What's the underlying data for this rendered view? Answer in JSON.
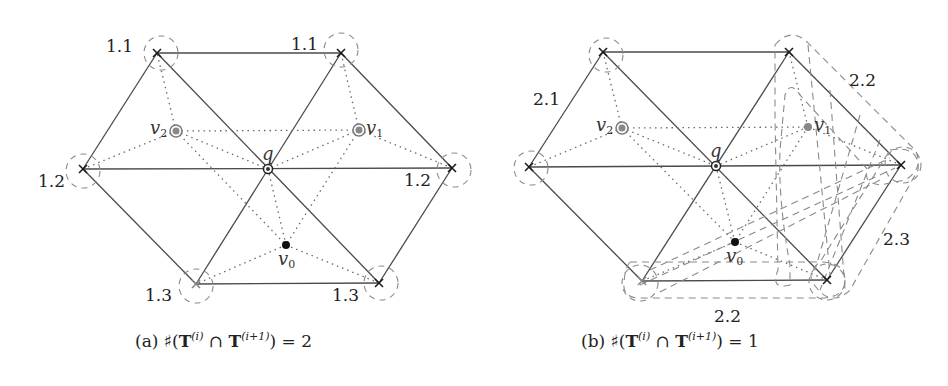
{
  "figure": {
    "panels": [
      {
        "id": "a",
        "caption_prefix": "(a)",
        "caption_expr": "♯(T(i) ∩ T(i+1)) = 2",
        "caption_parts": {
          "sharp": "♯(",
          "T1": "T",
          "sup1": "(i)",
          "cap": " ∩ ",
          "T2": "T",
          "sup2": "(i+1)",
          "tail": ") = 2"
        },
        "vertex_labels": [
          "1.1",
          "1.1",
          "1.2",
          "1.2",
          "1.3",
          "1.3"
        ],
        "points": {
          "q": "q",
          "v0": "v",
          "v0_sub": "0",
          "v1": "v",
          "v1_sub": "1",
          "v2": "v",
          "v2_sub": "2"
        }
      },
      {
        "id": "b",
        "caption_prefix": "(b)",
        "caption_expr": "♯(T(i) ∩ T(i+1)) = 1",
        "caption_parts": {
          "sharp": "♯(",
          "T1": "T",
          "sup1": "(i)",
          "cap": " ∩ ",
          "T2": "T",
          "sup2": "(i+1)",
          "tail": ") = 1"
        },
        "region_labels": [
          "2.1",
          "2.2",
          "2.3",
          "2.2"
        ],
        "points": {
          "q": "q",
          "v0": "v",
          "v0_sub": "0",
          "v1": "v",
          "v1_sub": "1",
          "v2": "v",
          "v2_sub": "2"
        }
      }
    ],
    "colors": {
      "edge": "#4a4a4a",
      "dotted": "#6a6a6a",
      "dashed": "#8a8a8a",
      "marker_gray": "#888888",
      "marker_black": "#111111"
    }
  }
}
